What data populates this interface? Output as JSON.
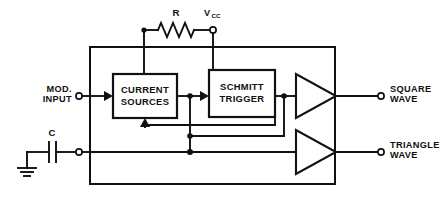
{
  "diagram": {
    "blocks": [
      {
        "id": "current_sources",
        "line1": "CURRENT",
        "line2": "SOURCES"
      },
      {
        "id": "schmitt_trigger",
        "line1": "SCHMITT",
        "line2": "TRIGGER"
      }
    ],
    "components": {
      "resistor": {
        "label": "R",
        "name": "resistor-r"
      },
      "capacitor": {
        "label": "C",
        "name": "capacitor-c"
      },
      "supply": {
        "label": "V",
        "subscript": "CC",
        "name": "vcc-supply"
      },
      "ground": {
        "name": "ground-symbol"
      }
    },
    "terminals": {
      "mod_input": {
        "line1": "MOD.",
        "line2": "INPUT"
      },
      "square_wave": {
        "line1": "SQUARE",
        "line2": "WAVE"
      },
      "triangle_wave": {
        "line1": "TRIANGLE",
        "line2": "WAVE"
      }
    },
    "buffers": [
      {
        "id": "square_buffer",
        "name": "square-wave-buffer"
      },
      {
        "id": "triangle_buffer",
        "name": "triangle-wave-buffer"
      }
    ],
    "colors": {
      "line": "#111111",
      "background": "#ffffff"
    }
  }
}
